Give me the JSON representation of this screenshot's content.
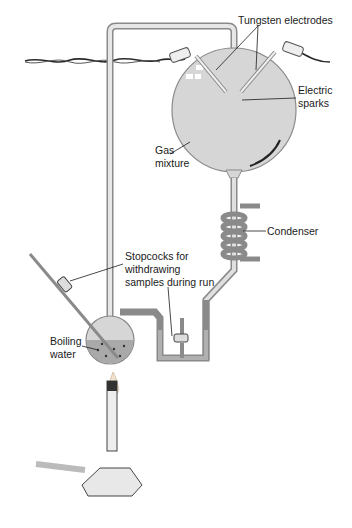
{
  "diagram": {
    "type": "apparatus-illustration",
    "labels": {
      "tungsten_electrodes": "Tungsten electrodes",
      "electric_sparks": "Electric\nsparks",
      "gas_mixture": "Gas\nmixture",
      "condenser": "Condenser",
      "stopcocks": "Stopcocks for\nwithdrawing\nsamples during run",
      "boiling_water": "Boiling\nwater"
    },
    "colors": {
      "glass_fill": "#d6d6d6",
      "glass_outline": "#8a8a8a",
      "water_fill": "#a9a9a9",
      "ink": "#1a1a1a",
      "flame": "#f2e3cf"
    }
  }
}
